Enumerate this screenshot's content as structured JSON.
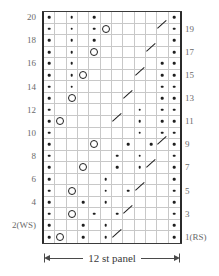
{
  "chart_data": {
    "type": "table",
    "title": "",
    "subtitle": "",
    "xlabel": "12 st panel",
    "ylabel": "",
    "columns": 12,
    "rows": 20,
    "grid": true,
    "legend": "",
    "row_labels_left": [
      "20",
      "18",
      "16",
      "14",
      "12",
      "10",
      "8",
      "6",
      "4",
      "2(WS)"
    ],
    "row_labels_right": [
      "19",
      "17",
      "15",
      "13",
      "11",
      "9",
      "7",
      "5",
      "3",
      "1(RS)"
    ],
    "symbol_names": {
      "dot": "purl-dot-symbol",
      "circle": "yarn-over-circle-symbol",
      "slash": "decrease-slash-symbol"
    },
    "colors": {
      "grid_line": "#c8c8c8",
      "border": "#2b2b2b",
      "symbol": "#1f1f1f",
      "label": "#6a6a6a",
      "background": "#ffffff"
    },
    "cells": [
      {
        "row": 20,
        "symbols": [
          {
            "col": 1,
            "type": "dot"
          },
          {
            "col": 3,
            "type": "dot"
          },
          {
            "col": 5,
            "type": "dot"
          },
          {
            "col": 12,
            "type": "dot"
          }
        ]
      },
      {
        "row": 19,
        "symbols": [
          {
            "col": 1,
            "type": "dot"
          },
          {
            "col": 3,
            "type": "dot"
          },
          {
            "col": 5,
            "type": "dot"
          },
          {
            "col": 6,
            "type": "circle"
          },
          {
            "col": 11,
            "type": "slash"
          },
          {
            "col": 12,
            "type": "dot"
          }
        ]
      },
      {
        "row": 18,
        "symbols": [
          {
            "col": 1,
            "type": "dot"
          },
          {
            "col": 3,
            "type": "dot"
          },
          {
            "col": 5,
            "type": "dot"
          },
          {
            "col": 12,
            "type": "dot"
          }
        ]
      },
      {
        "row": 17,
        "symbols": [
          {
            "col": 1,
            "type": "dot"
          },
          {
            "col": 3,
            "type": "dot"
          },
          {
            "col": 5,
            "type": "circle"
          },
          {
            "col": 10,
            "type": "slash"
          },
          {
            "col": 12,
            "type": "dot"
          }
        ]
      },
      {
        "row": 16,
        "symbols": [
          {
            "col": 1,
            "type": "dot"
          },
          {
            "col": 3,
            "type": "dot"
          },
          {
            "col": 11,
            "type": "dot"
          },
          {
            "col": 12,
            "type": "dot"
          }
        ]
      },
      {
        "row": 15,
        "symbols": [
          {
            "col": 1,
            "type": "dot"
          },
          {
            "col": 3,
            "type": "dot"
          },
          {
            "col": 4,
            "type": "circle"
          },
          {
            "col": 9,
            "type": "slash"
          },
          {
            "col": 11,
            "type": "dot"
          },
          {
            "col": 12,
            "type": "dot"
          }
        ]
      },
      {
        "row": 14,
        "symbols": [
          {
            "col": 1,
            "type": "dot"
          },
          {
            "col": 3,
            "type": "dot"
          },
          {
            "col": 11,
            "type": "dot"
          },
          {
            "col": 12,
            "type": "dot"
          }
        ]
      },
      {
        "row": 13,
        "symbols": [
          {
            "col": 1,
            "type": "dot"
          },
          {
            "col": 3,
            "type": "circle"
          },
          {
            "col": 8,
            "type": "slash"
          },
          {
            "col": 11,
            "type": "dot"
          },
          {
            "col": 12,
            "type": "dot"
          }
        ]
      },
      {
        "row": 12,
        "symbols": [
          {
            "col": 1,
            "type": "dot"
          },
          {
            "col": 9,
            "type": "dot"
          },
          {
            "col": 11,
            "type": "dot"
          },
          {
            "col": 12,
            "type": "dot"
          }
        ]
      },
      {
        "row": 11,
        "symbols": [
          {
            "col": 1,
            "type": "dot"
          },
          {
            "col": 2,
            "type": "circle"
          },
          {
            "col": 7,
            "type": "slash"
          },
          {
            "col": 9,
            "type": "dot"
          },
          {
            "col": 11,
            "type": "dot"
          },
          {
            "col": 12,
            "type": "dot"
          }
        ]
      },
      {
        "row": 10,
        "symbols": [
          {
            "col": 1,
            "type": "dot"
          },
          {
            "col": 9,
            "type": "dot"
          },
          {
            "col": 11,
            "type": "dot"
          },
          {
            "col": 12,
            "type": "dot"
          }
        ]
      },
      {
        "row": 9,
        "symbols": [
          {
            "col": 1,
            "type": "dot"
          },
          {
            "col": 5,
            "type": "circle"
          },
          {
            "col": 8,
            "type": "dot"
          },
          {
            "col": 10,
            "type": "dot"
          },
          {
            "col": 11,
            "type": "slash"
          },
          {
            "col": 12,
            "type": "dot"
          }
        ]
      },
      {
        "row": 8,
        "symbols": [
          {
            "col": 1,
            "type": "dot"
          },
          {
            "col": 7,
            "type": "dot"
          },
          {
            "col": 9,
            "type": "dot"
          },
          {
            "col": 12,
            "type": "dot"
          }
        ]
      },
      {
        "row": 7,
        "symbols": [
          {
            "col": 1,
            "type": "dot"
          },
          {
            "col": 4,
            "type": "circle"
          },
          {
            "col": 7,
            "type": "dot"
          },
          {
            "col": 9,
            "type": "dot"
          },
          {
            "col": 10,
            "type": "slash"
          },
          {
            "col": 12,
            "type": "dot"
          }
        ]
      },
      {
        "row": 6,
        "symbols": [
          {
            "col": 1,
            "type": "dot"
          },
          {
            "col": 6,
            "type": "dot"
          },
          {
            "col": 12,
            "type": "dot"
          }
        ]
      },
      {
        "row": 5,
        "symbols": [
          {
            "col": 1,
            "type": "dot"
          },
          {
            "col": 3,
            "type": "circle"
          },
          {
            "col": 6,
            "type": "dot"
          },
          {
            "col": 8,
            "type": "dot"
          },
          {
            "col": 9,
            "type": "slash"
          },
          {
            "col": 12,
            "type": "dot"
          }
        ]
      },
      {
        "row": 4,
        "symbols": [
          {
            "col": 1,
            "type": "dot"
          },
          {
            "col": 4,
            "type": "dot"
          },
          {
            "col": 6,
            "type": "dot"
          },
          {
            "col": 12,
            "type": "dot"
          }
        ]
      },
      {
        "row": 3,
        "symbols": [
          {
            "col": 1,
            "type": "dot"
          },
          {
            "col": 3,
            "type": "circle"
          },
          {
            "col": 5,
            "type": "dot"
          },
          {
            "col": 7,
            "type": "dot"
          },
          {
            "col": 8,
            "type": "slash"
          },
          {
            "col": 12,
            "type": "dot"
          }
        ]
      },
      {
        "row": 2,
        "symbols": [
          {
            "col": 1,
            "type": "dot"
          },
          {
            "col": 4,
            "type": "dot"
          },
          {
            "col": 6,
            "type": "dot"
          },
          {
            "col": 12,
            "type": "dot"
          }
        ]
      },
      {
        "row": 1,
        "symbols": [
          {
            "col": 1,
            "type": "dot"
          },
          {
            "col": 2,
            "type": "circle"
          },
          {
            "col": 4,
            "type": "dot"
          },
          {
            "col": 6,
            "type": "dot"
          },
          {
            "col": 7,
            "type": "slash"
          },
          {
            "col": 12,
            "type": "dot"
          }
        ]
      }
    ]
  },
  "caption": {
    "panel_label": "12 st panel"
  }
}
